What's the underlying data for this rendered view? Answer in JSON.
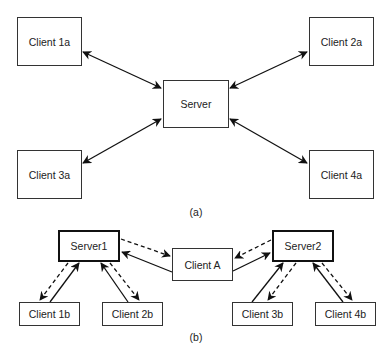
{
  "diagram_a": {
    "caption": "(a)",
    "nodes": [
      {
        "id": "client1a",
        "label": "Client 1a"
      },
      {
        "id": "client2a",
        "label": "Client 2a"
      },
      {
        "id": "server",
        "label": "Server"
      },
      {
        "id": "client3a",
        "label": "Client 3a"
      },
      {
        "id": "client4a",
        "label": "Client 4a"
      }
    ],
    "edges": [
      {
        "from": "client1a",
        "to": "server",
        "style": "solid",
        "direction": "bidirectional"
      },
      {
        "from": "client2a",
        "to": "server",
        "style": "solid",
        "direction": "bidirectional"
      },
      {
        "from": "client3a",
        "to": "server",
        "style": "solid",
        "direction": "bidirectional"
      },
      {
        "from": "client4a",
        "to": "server",
        "style": "solid",
        "direction": "bidirectional"
      }
    ]
  },
  "diagram_b": {
    "caption": "(b)",
    "nodes": [
      {
        "id": "server1",
        "label": "Server1"
      },
      {
        "id": "server2",
        "label": "Server2"
      },
      {
        "id": "clientA",
        "label": "Client A"
      },
      {
        "id": "client1b",
        "label": "Client 1b"
      },
      {
        "id": "client2b",
        "label": "Client 2b"
      },
      {
        "id": "client3b",
        "label": "Client 3b"
      },
      {
        "id": "client4b",
        "label": "Client 4b"
      }
    ],
    "edges": [
      {
        "from": "clientA",
        "to": "server1",
        "style": "solid"
      },
      {
        "from": "server1",
        "to": "clientA",
        "style": "dashed"
      },
      {
        "from": "clientA",
        "to": "server2",
        "style": "solid"
      },
      {
        "from": "server2",
        "to": "clientA",
        "style": "dashed"
      },
      {
        "from": "client1b",
        "to": "server1",
        "style": "solid"
      },
      {
        "from": "server1",
        "to": "client1b",
        "style": "dashed"
      },
      {
        "from": "client2b",
        "to": "server1",
        "style": "solid"
      },
      {
        "from": "server1",
        "to": "client2b",
        "style": "dashed"
      },
      {
        "from": "client3b",
        "to": "server2",
        "style": "solid"
      },
      {
        "from": "server2",
        "to": "client3b",
        "style": "dashed"
      },
      {
        "from": "client4b",
        "to": "server2",
        "style": "solid"
      },
      {
        "from": "server2",
        "to": "client4b",
        "style": "dashed"
      }
    ]
  }
}
